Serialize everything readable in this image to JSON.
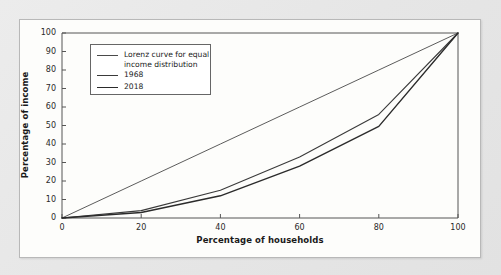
{
  "chart_data": {
    "type": "line",
    "title": "",
    "subtitle": "",
    "xlabel": "Percentage of households",
    "ylabel": "Percentage of income",
    "xlim": [
      0,
      100
    ],
    "ylim": [
      0,
      100
    ],
    "xticks": [
      "0",
      "20",
      "40",
      "60",
      "80",
      "100"
    ],
    "yticks": [
      "0",
      "10",
      "20",
      "30",
      "40",
      "50",
      "60",
      "70",
      "80",
      "90",
      "100"
    ],
    "grid": false,
    "legend_position": "upper-left-inside",
    "x": [
      0,
      20,
      40,
      60,
      80,
      100
    ],
    "series": [
      {
        "name": "Lorenz curve for equal\nincome distribution",
        "label_lines": [
          "Lorenz curve for equal",
          "income distribution"
        ],
        "values": [
          0,
          20,
          40,
          60,
          80,
          100
        ],
        "color": "#4a4a4a",
        "width": 0.9
      },
      {
        "name": "1968",
        "label_lines": [
          "1968"
        ],
        "values": [
          0,
          4,
          15,
          33,
          56,
          100
        ],
        "color": "#3a3a3a",
        "width": 1.1
      },
      {
        "name": "2018",
        "label_lines": [
          "2018"
        ],
        "values": [
          0,
          3,
          12,
          28,
          49.5,
          100
        ],
        "color": "#2b2b2b",
        "width": 1.4
      }
    ]
  },
  "figure": {
    "page_background": "#e9e9e9",
    "card_background": "#fdfdfb",
    "card_border_color": "#b8b8b8",
    "axis_color": "#555555",
    "legend_border_color": "#666666"
  }
}
